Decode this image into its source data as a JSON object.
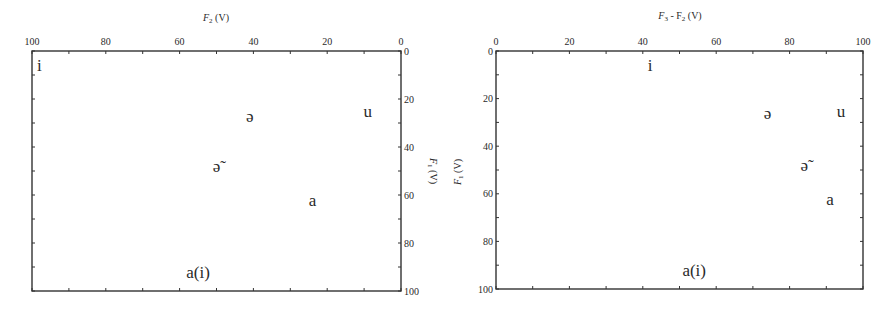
{
  "chart_data": [
    {
      "type": "scatter",
      "title": "",
      "xlabel": "F2 (V)",
      "ylabel": "F1 (V)",
      "x_axis_position": "top",
      "y_axis_position": "right",
      "xlim": [
        100,
        0
      ],
      "ylim": [
        100,
        0
      ],
      "x_reversed": true,
      "y_reversed": true,
      "xticks": [
        100,
        80,
        60,
        40,
        20,
        0
      ],
      "yticks": [
        0,
        20,
        40,
        60,
        80,
        100
      ],
      "grid": false,
      "points": [
        {
          "label": "i",
          "x": 98,
          "y": 6
        },
        {
          "label": "ə",
          "x": 41,
          "y": 27
        },
        {
          "label": "u",
          "x": 9,
          "y": 25
        },
        {
          "label": "ə̃",
          "x": 50,
          "y": 48
        },
        {
          "label": "a",
          "x": 24,
          "y": 62
        },
        {
          "label": "a(i)",
          "x": 55,
          "y": 92
        }
      ]
    },
    {
      "type": "scatter",
      "title": "",
      "xlabel": "F3 - F2 (V)",
      "ylabel": "F1 (V)",
      "x_axis_position": "top",
      "y_axis_position": "left",
      "xlim": [
        0,
        100
      ],
      "ylim": [
        100,
        0
      ],
      "x_reversed": false,
      "y_reversed": true,
      "xticks": [
        0,
        20,
        40,
        60,
        80,
        100
      ],
      "yticks": [
        0,
        20,
        40,
        60,
        80,
        100
      ],
      "grid": false,
      "points": [
        {
          "label": "i",
          "x": 42,
          "y": 6
        },
        {
          "label": "ə",
          "x": 74,
          "y": 26
        },
        {
          "label": "u",
          "x": 94,
          "y": 25
        },
        {
          "label": "ə̃",
          "x": 84,
          "y": 48
        },
        {
          "label": "a",
          "x": 91,
          "y": 62
        },
        {
          "label": "a(i)",
          "x": 54,
          "y": 92
        }
      ]
    }
  ],
  "charts": {
    "left": {
      "xlabel_main": "F",
      "xlabel_sub": "2",
      "xlabel_unit": " (V)",
      "ylabel_main": "F",
      "ylabel_sub": "1",
      "ylabel_unit": " (V)"
    },
    "right": {
      "xlabel_main": "F",
      "xlabel_sub": "3",
      "xlabel_mid": " - F",
      "xlabel_sub2": "2",
      "xlabel_unit": " (V)",
      "ylabel_main": "F",
      "ylabel_sub": "1",
      "ylabel_unit": " (V)"
    }
  }
}
